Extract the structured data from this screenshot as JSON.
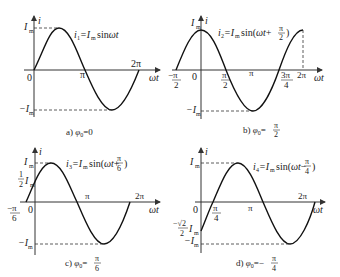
{
  "panels": [
    {
      "id": "a",
      "formula": "i₁=Iₘsinωt",
      "caption": "a) φ₀=0",
      "labels": {
        "y_axis": "i",
        "x_axis": "ωt",
        "Im": "Iₘ",
        "neg_Im": "−Iₘ",
        "origin": "0",
        "pi": "π",
        "two_pi": "2π"
      }
    },
    {
      "id": "b",
      "formula": "i₂=Iₘsin(ωt+π/2)",
      "caption": "b) φ₀=π/2",
      "labels": {
        "y_axis": "i",
        "x_axis": "ωt",
        "Im": "Iₘ",
        "neg_Im": "−Iₘ",
        "origin": "0",
        "neg_pi_2": "−π/2",
        "pi_2": "π/2",
        "pi": "π",
        "three_pi_4": "3π/4",
        "two_pi": "2π"
      }
    },
    {
      "id": "c",
      "formula": "i₃=Iₘsin(ωt+π/6)",
      "caption": "c) φ₀=π/6",
      "labels": {
        "y_axis": "i",
        "x_axis": "ωt",
        "Im": "Iₘ",
        "half_Im": "½Iₘ",
        "neg_Im": "−Iₘ",
        "origin": "0",
        "neg_pi_6": "−π/6",
        "pi": "π",
        "two_pi": "2π"
      }
    },
    {
      "id": "d",
      "formula": "i₄=Iₘsin(ωt−π/4)",
      "caption": "d) φ₀=−π/4",
      "labels": {
        "y_axis": "i",
        "x_axis": "ωt",
        "Im": "Iₘ",
        "neg_sqrt2_2_Im": "−(√2/2)Iₘ",
        "neg_Im": "−Iₘ",
        "origin": "0",
        "pi_4": "π/4",
        "pi": "π",
        "two_pi": "2π"
      }
    }
  ],
  "t": {
    "i": "i",
    "wt": "ωt",
    "I": "I",
    "m": "m",
    "zero": "0",
    "pi": "π",
    "two_pi": "2π",
    "minus": "−",
    "one": "1",
    "two": "2",
    "three_pi": "3π",
    "four": "4",
    "six": "6",
    "sqrt2": "√2",
    "a_formula_pre": "i",
    "a_formula_sub": "1",
    "a_formula_mid": "=I",
    "a_formula_msub": "m",
    "a_formula_post": "sinωt",
    "b_formula_sub": "2",
    "b_formula_post": "sin(ωt+",
    "c_formula_sub": "3",
    "c_formula_post": "sin(ωt+",
    "d_formula_sub": "4",
    "d_formula_post": "sin(ωt−",
    "close": ")",
    "cap_a": "a) φ",
    "cap_zero_sub": "0",
    "cap_a_val": "=0",
    "cap_b": "b) φ",
    "cap_c": "c) φ",
    "cap_d": "d) φ",
    "eq": "=",
    "eq_minus": "=−"
  }
}
